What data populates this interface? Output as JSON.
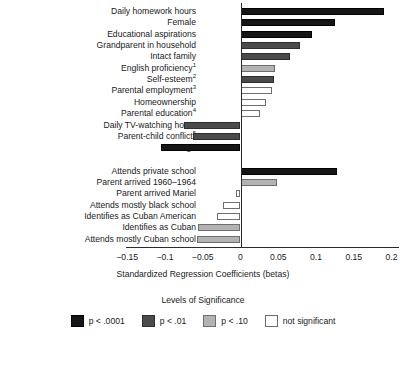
{
  "chart_data": {
    "type": "bar",
    "orientation": "horizontal",
    "title": "",
    "xlabel": "Standardized Regression Coefficients (betas)",
    "ylabel": "",
    "xlim": [
      -0.175,
      0.205
    ],
    "xticks": [
      -0.15,
      -0.1,
      -0.05,
      0,
      0.05,
      0.1,
      0.15,
      0.2
    ],
    "xtick_labels": [
      "−0.15",
      "−0.1",
      "−0.05",
      "0",
      "0.05",
      "0.1",
      "0.15",
      "0.2"
    ],
    "grid": false,
    "legend_position": "bottom",
    "groups": [
      {
        "name": "group-1",
        "bars": [
          {
            "label": "Daily homework hours",
            "footnote": "",
            "value": 0.19,
            "significance": "sig1"
          },
          {
            "label": "Female",
            "footnote": "",
            "value": 0.125,
            "significance": "sig1"
          },
          {
            "label": "Educational aspirations",
            "footnote": "",
            "value": 0.095,
            "significance": "sig1"
          },
          {
            "label": "Grandparent in household",
            "footnote": "",
            "value": 0.079,
            "significance": "sig2"
          },
          {
            "label": "Intact family",
            "footnote": "",
            "value": 0.065,
            "significance": "sig2"
          },
          {
            "label": "English proficiency",
            "footnote": "1",
            "value": 0.046,
            "significance": "sig3"
          },
          {
            "label": "Self-esteem",
            "footnote": "2",
            "value": 0.045,
            "significance": "sig2"
          },
          {
            "label": "Parental employment",
            "footnote": "3",
            "value": 0.042,
            "significance": "sig4"
          },
          {
            "label": "Homeownership",
            "footnote": "",
            "value": 0.034,
            "significance": "sig4"
          },
          {
            "label": "Parental education",
            "footnote": "4",
            "value": 0.026,
            "significance": "sig4"
          },
          {
            "label": "Daily TV-watching hours",
            "footnote": "",
            "value": -0.075,
            "significance": "sig2"
          },
          {
            "label": "Parent-child conflict",
            "footnote": "5",
            "value": -0.063,
            "significance": "sig2"
          },
          {
            "label": "Age",
            "footnote": "",
            "value": -0.105,
            "significance": "sig1"
          }
        ]
      },
      {
        "name": "group-2",
        "bars": [
          {
            "label": "Attends private school",
            "footnote": "",
            "value": 0.128,
            "significance": "sig1"
          },
          {
            "label": "Parent arrived 1960–1964",
            "footnote": "",
            "value": 0.048,
            "significance": "sig3"
          },
          {
            "label": "Parent arrived Mariel",
            "footnote": "",
            "value": -0.006,
            "significance": "sig4"
          },
          {
            "label": "Attends mostly black school",
            "footnote": "",
            "value": -0.023,
            "significance": "sig4"
          },
          {
            "label": "Identifies as Cuban American",
            "footnote": "",
            "value": -0.031,
            "significance": "sig4"
          },
          {
            "label": "Identifies as Cuban",
            "footnote": "",
            "value": -0.056,
            "significance": "sig3"
          },
          {
            "label": "Attends mostly Cuban school",
            "footnote": "",
            "value": -0.058,
            "significance": "sig3"
          }
        ]
      }
    ],
    "legend": {
      "title": "Levels of Significance",
      "entries": [
        {
          "label": "p < .0001",
          "significance": "sig1",
          "color": "#161616"
        },
        {
          "label": "p < .01",
          "significance": "sig2",
          "color": "#4b4b4b"
        },
        {
          "label": "p < .10",
          "significance": "sig3",
          "color": "#b3b3b3"
        },
        {
          "label": "not significant",
          "significance": "sig4",
          "color": "#ffffff"
        }
      ]
    }
  }
}
